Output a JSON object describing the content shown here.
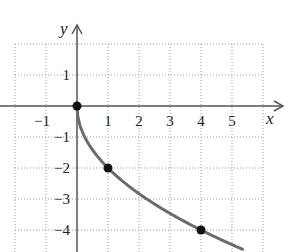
{
  "chart_data": {
    "type": "line",
    "title": "",
    "xlabel": "x",
    "ylabel": "y",
    "xlim": [
      -2,
      6
    ],
    "ylim": [
      -4.5,
      2
    ],
    "grid": true,
    "grid_style": "dotted",
    "x_ticks": [
      "−1",
      "1",
      "2",
      "3",
      "4",
      "5"
    ],
    "y_ticks": [
      "1",
      "−1",
      "−2",
      "−3",
      "−4"
    ],
    "series": [
      {
        "name": "y = -2√x",
        "color": "#6b6b6b",
        "x": [
          0,
          0.25,
          1,
          2,
          3,
          4,
          5.3
        ],
        "y": [
          0,
          -1,
          -2,
          -2.83,
          -3.46,
          -4,
          -4.6
        ]
      }
    ],
    "points": [
      {
        "x": 0,
        "y": 0
      },
      {
        "x": 1,
        "y": -2
      },
      {
        "x": 4,
        "y": -4
      }
    ]
  }
}
